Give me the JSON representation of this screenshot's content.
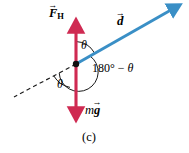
{
  "figure": {
    "caption": "(c)",
    "type": "vector-force-diagram"
  },
  "colors": {
    "force_vector": "#cf2a52",
    "displacement_vector": "#3a8fc6",
    "construction_line": "#1a1a1a",
    "arc": "#1a1a1a",
    "background": "#ffffff",
    "text": "#000000"
  },
  "labels": {
    "force": {
      "accent": "→",
      "base": "F",
      "subscript": "H",
      "full": "FₒH (vector)"
    },
    "displacement": {
      "accent": "→",
      "base": "d"
    },
    "weight": {
      "mass": "m",
      "accent": "→",
      "base": "g"
    },
    "theta_top": "θ",
    "theta_bottom": "θ",
    "supplement_prefix": "180° − ",
    "supplement_theta": "θ"
  },
  "geometry": {
    "origin": {
      "x": 76,
      "y": 64
    },
    "force_up_arrow": {
      "x1": 76,
      "y1": 64,
      "x2": 76,
      "y2": 22
    },
    "force_down_arrow": {
      "x1": 76,
      "y1": 64,
      "x2": 76,
      "y2": 118
    },
    "displacement_arrow": {
      "x1": 76,
      "y1": 64,
      "x2": 178,
      "y2": 5
    },
    "dashed_line": {
      "x1": 76,
      "y1": 64,
      "x2": 14,
      "y2": 97
    },
    "origin_dot_radius": 3.2
  }
}
